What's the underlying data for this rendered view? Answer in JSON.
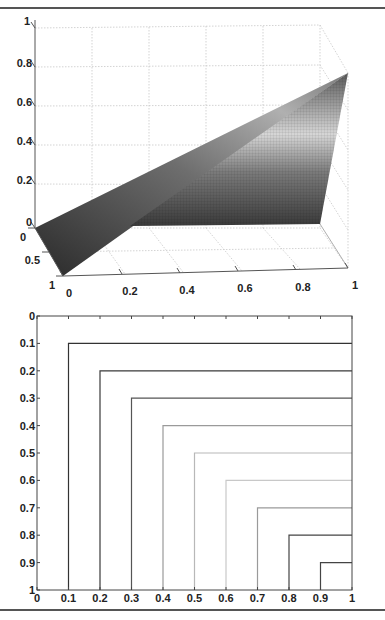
{
  "chart_data": [
    {
      "type": "surface",
      "title": "",
      "xlabel": "",
      "ylabel": "",
      "zlabel": "",
      "xlim": [
        0,
        1
      ],
      "ylim": [
        0,
        1
      ],
      "zlim": [
        0,
        1
      ],
      "x_ticks": [
        "0",
        "0.2",
        "0.4",
        "0.6",
        "0.8",
        "1"
      ],
      "y_ticks": [
        "0",
        "0.5",
        "1"
      ],
      "z_ticks": [
        "0",
        "0.2",
        "0.4",
        "0.6",
        "0.8",
        "1"
      ],
      "grid": true,
      "colormap": "gray",
      "description": "Piecewise-planar surface rising from z=0 along the y-edge at x=0 to z=0.8 at the corner (x=1,y=0); flat region z=0 over the far part of the domain"
    },
    {
      "type": "line",
      "title": "",
      "xlabel": "",
      "ylabel": "",
      "xlim": [
        0,
        1
      ],
      "ylim": [
        0,
        1
      ],
      "y_reversed": true,
      "x_ticks": [
        "0",
        "0.1",
        "0.2",
        "0.3",
        "0.4",
        "0.5",
        "0.6",
        "0.7",
        "0.8",
        "0.9",
        "1"
      ],
      "y_ticks": [
        "0",
        "0.1",
        "0.2",
        "0.3",
        "0.4",
        "0.5",
        "0.6",
        "0.7",
        "0.8",
        "0.9",
        "1"
      ],
      "grid": false,
      "series": [
        {
          "name": "level-0.1",
          "x": [
            0.1,
            0.1,
            1
          ],
          "y": [
            1,
            0.1,
            0.1
          ],
          "color": "#333333"
        },
        {
          "name": "level-0.2",
          "x": [
            0.2,
            0.2,
            1
          ],
          "y": [
            1,
            0.2,
            0.2
          ],
          "color": "#3a3a3a"
        },
        {
          "name": "level-0.3",
          "x": [
            0.3,
            0.3,
            1
          ],
          "y": [
            1,
            0.3,
            0.3
          ],
          "color": "#555555"
        },
        {
          "name": "level-0.4",
          "x": [
            0.4,
            0.4,
            1
          ],
          "y": [
            1,
            0.4,
            0.4
          ],
          "color": "#9a9a9a"
        },
        {
          "name": "level-0.5",
          "x": [
            0.5,
            0.5,
            1
          ],
          "y": [
            1,
            0.5,
            0.5
          ],
          "color": "#b8b8b8"
        },
        {
          "name": "level-0.6",
          "x": [
            0.6,
            0.6,
            1
          ],
          "y": [
            1,
            0.6,
            0.6
          ],
          "color": "#c8c8c8"
        },
        {
          "name": "level-0.7",
          "x": [
            0.7,
            0.7,
            1
          ],
          "y": [
            1,
            0.7,
            0.7
          ],
          "color": "#9a9a9a"
        },
        {
          "name": "level-0.8",
          "x": [
            0.8,
            0.8,
            1
          ],
          "y": [
            1,
            0.8,
            0.8
          ],
          "color": "#444444"
        },
        {
          "name": "level-0.9",
          "x": [
            0.9,
            0.9,
            1
          ],
          "y": [
            1,
            0.9,
            0.9
          ],
          "color": "#444444"
        }
      ]
    }
  ]
}
